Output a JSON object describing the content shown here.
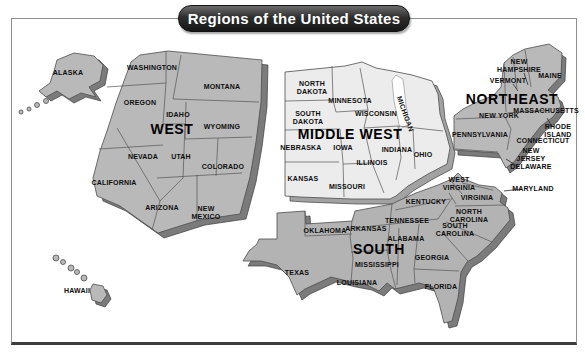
{
  "title": "Regions of the United States",
  "colors": {
    "west_fill": "#b9b9b9",
    "middle_west_fill": "#ececec",
    "northeast_fill": "#b9b9b9",
    "south_fill": "#b3b3b3",
    "side_fill": "#7b7b7b",
    "side_fill_light": "#a2a2a2",
    "water": "#fdfdfd",
    "banner": "#2e2e2e"
  },
  "regions": {
    "west": {
      "label": "WEST",
      "states": {
        "alaska": "ALASKA",
        "hawaii": "HAWAII",
        "washington": "WASHINGTON",
        "oregon": "OREGON",
        "california": "CALIFORNIA",
        "montana": "MONTANA",
        "idaho": "IDAHO",
        "nevada": "NEVADA",
        "utah": "UTAH",
        "wyoming": "WYOMING",
        "colorado": "COLORADO",
        "arizona": "ARIZONA",
        "new_mexico": "NEW\nMEXICO"
      }
    },
    "middle_west": {
      "label": "MIDDLE WEST",
      "states": {
        "north_dakota": "NORTH\nDAKOTA",
        "south_dakota": "SOUTH\nDAKOTA",
        "minnesota": "MINNESOTA",
        "wisconsin": "WISCONSIN",
        "michigan": "MICHIGAN",
        "nebraska": "NEBRASKA",
        "iowa": "IOWA",
        "kansas": "KANSAS",
        "missouri": "MISSOURI",
        "illinois": "ILLINOIS",
        "indiana": "INDIANA",
        "ohio": "OHIO"
      }
    },
    "northeast": {
      "label": "NORTHEAST",
      "states": {
        "maine": "MAINE",
        "new_hampshire": "NEW\nHAMPSHIRE",
        "vermont": "VERMONT",
        "new_york": "NEW YORK",
        "massachusetts": "MASSACHUSETTS",
        "rhode_island": "RHODE\nISLAND",
        "connecticut": "CONNECTICUT",
        "pennsylvania": "PENNSYLVANIA",
        "new_jersey": "NEW\nJERSEY",
        "delaware": "DELAWARE"
      }
    },
    "south": {
      "label": "SOUTH",
      "states": {
        "west_virginia": "WEST\nVIRGINIA",
        "maryland": "MARYLAND",
        "virginia": "VIRGINIA",
        "kentucky": "KENTUCKY",
        "north_carolina": "NORTH\nCAROLINA",
        "south_carolina": "SOUTH\nCAROLINA",
        "tennessee": "TENNESSEE",
        "arkansas": "ARKANSAS",
        "oklahoma": "OKLAHOMA",
        "texas": "TEXAS",
        "louisiana": "LOUISIANA",
        "mississippi": "MISSISSIPPI",
        "alabama": "ALABAMA",
        "georgia": "GEORGIA",
        "florida": "FLORIDA"
      }
    }
  }
}
